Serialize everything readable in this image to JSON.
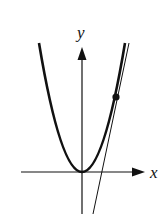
{
  "diagram": {
    "labels": {
      "x_axis": "x",
      "y_axis": "y"
    },
    "colors": {
      "stroke": "#111111",
      "background": "#ffffff"
    },
    "elements": [
      "x-axis",
      "y-axis",
      "parabola",
      "tangent-line",
      "point-of-tangency"
    ]
  }
}
